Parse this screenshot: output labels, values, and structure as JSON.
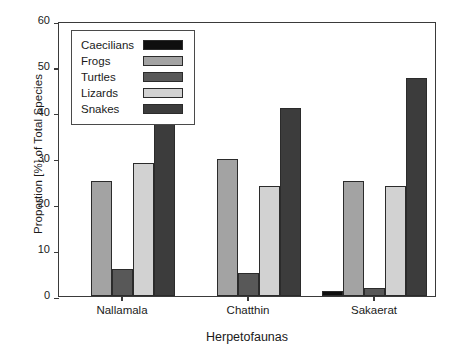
{
  "chart_data": {
    "type": "bar",
    "title": "",
    "xlabel": "Herpetofaunas",
    "ylabel": "Proportion [%] of Total Species",
    "categories": [
      "Nallamala",
      "Chatthin",
      "Sakaerat"
    ],
    "ylim": [
      0,
      60
    ],
    "yticks": [
      0,
      10,
      20,
      30,
      40,
      50,
      60
    ],
    "grid": false,
    "legend_position": "top-left",
    "series": [
      {
        "name": "Caecilians",
        "color": "#0f0f0f",
        "values": [
          0,
          0,
          1
        ]
      },
      {
        "name": "Frogs",
        "color": "#a3a3a3",
        "values": [
          25,
          30,
          25
        ]
      },
      {
        "name": "Turtles",
        "color": "#585858",
        "values": [
          6,
          5,
          1.7
        ]
      },
      {
        "name": "Lizards",
        "color": "#d2d2d2",
        "values": [
          29,
          24,
          24
        ]
      },
      {
        "name": "Snakes",
        "color": "#3c3c3c",
        "values": [
          40,
          41,
          47.5
        ]
      }
    ]
  },
  "axis": {
    "y_tick_labels": [
      "0",
      "10",
      "20",
      "30",
      "40",
      "50",
      "60"
    ],
    "x_tick_labels": [
      "Nallamala",
      "Chatthin",
      "Sakaerat"
    ],
    "y_title": "Proportion [%] of Total Species",
    "x_title": "Herpetofaunas"
  },
  "legend": {
    "entries": [
      {
        "label": "Caecilians"
      },
      {
        "label": "Frogs"
      },
      {
        "label": "Turtles"
      },
      {
        "label": "Lizards"
      },
      {
        "label": "Snakes"
      }
    ]
  }
}
